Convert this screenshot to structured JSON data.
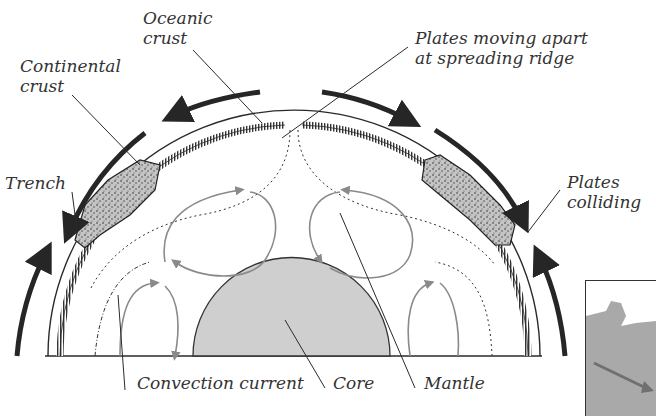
{
  "diagram": {
    "type": "plate-tectonics-cross-section",
    "colors": {
      "ink": "#2a2a2a",
      "arrow": "#262626",
      "convection": "#8a8a8a",
      "core_fill": "#cfcfcf",
      "crust_fill": "#b8b8b8",
      "inset_fill": "#a9a9a9",
      "inset_arrow": "#707070"
    },
    "labels": {
      "oceanic_crust": [
        "Oceanic",
        "crust"
      ],
      "continental_crust": [
        "Continental",
        "crust"
      ],
      "plates_moving_apart": [
        "Plates moving apart",
        "at spreading ridge"
      ],
      "trench": [
        "Trench"
      ],
      "plates_colliding": [
        "Plates",
        "colliding"
      ],
      "convection_current": [
        "Convection current"
      ],
      "core": [
        "Core"
      ],
      "mantle": [
        "Mantle"
      ]
    }
  }
}
